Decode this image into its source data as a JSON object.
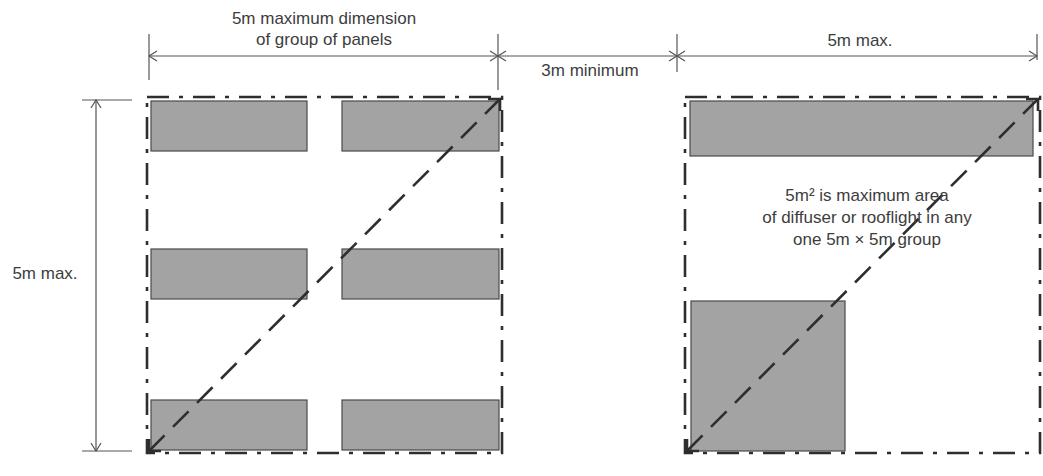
{
  "labels": {
    "group_width_line1": "5m maximum dimension",
    "group_width_line2": "of group of panels",
    "gap": "3m minimum",
    "right_width": "5m max.",
    "height": "5m max.",
    "note_line1": "5m² is maximum area",
    "note_line2": "of diffuser or rooflight in any",
    "note_line3": "one 5m × 5m group"
  },
  "colors": {
    "panel_fill": "#a3a3a3",
    "panel_stroke": "#4a4a4a",
    "line": "#555555",
    "boundary": "#2e2e2e"
  },
  "left_group": {
    "box": [
      147,
      97,
      502,
      453
    ],
    "panels": [
      {
        "x": 151,
        "y": 101,
        "w": 156,
        "h": 50
      },
      {
        "x": 342,
        "y": 101,
        "w": 157,
        "h": 50
      },
      {
        "x": 151,
        "y": 249,
        "w": 156,
        "h": 50
      },
      {
        "x": 342,
        "y": 249,
        "w": 157,
        "h": 50
      },
      {
        "x": 151,
        "y": 400,
        "w": 156,
        "h": 50
      },
      {
        "x": 342,
        "y": 400,
        "w": 157,
        "h": 50
      }
    ]
  },
  "right_group": {
    "box": [
      685,
      97,
      1040,
      453
    ],
    "panels": [
      {
        "x": 690,
        "y": 101,
        "w": 343,
        "h": 55
      },
      {
        "x": 691,
        "y": 301,
        "w": 154,
        "h": 150
      }
    ]
  }
}
